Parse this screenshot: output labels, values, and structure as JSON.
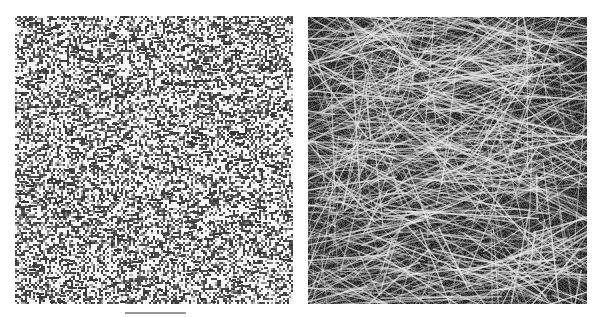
{
  "figure": {
    "background": "#ffffff",
    "panels": [
      {
        "id": "left",
        "description": "noise texture",
        "x": 15,
        "y": 16,
        "width": 278,
        "height": 288,
        "pixel_size": 2,
        "dark_color": "#3c3c3c",
        "light_color": "#f4f4f4",
        "dark_fraction": 0.5,
        "seed": 17
      },
      {
        "id": "right",
        "description": "fiber network texture",
        "x": 308,
        "y": 17,
        "width": 279,
        "height": 287,
        "background_color": "#1e1e1e",
        "noise_seed": 91,
        "fiber_count": 900,
        "fiber_color": "#e6e6e6",
        "fiber_min_len": 30,
        "fiber_max_len": 160,
        "seed": 42
      }
    ],
    "scale_bar": {
      "x": 125,
      "y": 312,
      "width": 61,
      "height": 2,
      "color": "#9a9a9a"
    }
  }
}
